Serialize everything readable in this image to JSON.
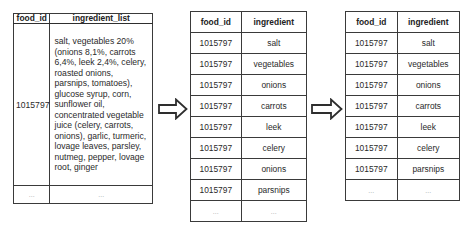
{
  "diagram": {
    "tables": [
      {
        "name": "source",
        "headers": [
          "food_id",
          "ingredient_list"
        ],
        "rows": [
          [
            "1015797",
            "salt, vegetables 20% (onions 8,1%, carrots 6,4%, leek 2,4%, celery, roasted onions, parsnips, tomatoes), glucose syrup, corn, sunflower oil, concentrated vegetable juice (celery, carrots, onions), garlic, turmeric, lovage leaves, parsley, nutmeg, pepper, lovage root, ginger"
          ],
          [
            "...",
            "..."
          ]
        ]
      },
      {
        "name": "split",
        "headers": [
          "food_id",
          "ingredient"
        ],
        "rows": [
          [
            "1015797",
            "salt"
          ],
          [
            "1015797",
            "vegetables"
          ],
          [
            "1015797",
            "onions"
          ],
          [
            "1015797",
            "carrots"
          ],
          [
            "1015797",
            "leek"
          ],
          [
            "1015797",
            "celery"
          ],
          [
            "1015797",
            "onions"
          ],
          [
            "1015797",
            "parsnips"
          ],
          [
            "...",
            "..."
          ]
        ]
      },
      {
        "name": "deduplicated",
        "headers": [
          "food_id",
          "ingredient"
        ],
        "rows": [
          [
            "1015797",
            "salt"
          ],
          [
            "1015797",
            "vegetables"
          ],
          [
            "1015797",
            "onions"
          ],
          [
            "1015797",
            "carrots"
          ],
          [
            "1015797",
            "leek"
          ],
          [
            "1015797",
            "celery"
          ],
          [
            "1015797",
            "parsnips"
          ],
          [
            "...",
            "..."
          ]
        ]
      }
    ],
    "arrows": [
      {
        "from": "source",
        "to": "split",
        "icon": "right-arrow-icon"
      },
      {
        "from": "split",
        "to": "deduplicated",
        "icon": "right-arrow-icon"
      }
    ]
  }
}
